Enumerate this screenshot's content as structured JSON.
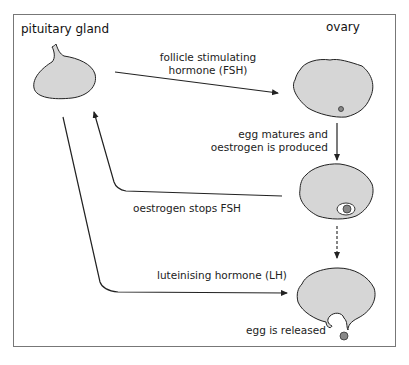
{
  "titles": {
    "pituitary": "pituitary gland",
    "ovary": "ovary"
  },
  "labels": {
    "fsh_line1": "follicle stimulating",
    "fsh_line2": "hormone (FSH)",
    "matures_line1": "egg matures and",
    "matures_line2": "oestrogen is produced",
    "oestrogen_stops": "oestrogen stops FSH",
    "lh": "luteinising hormone (LH)",
    "released": "egg is released"
  },
  "caption": "Hormonal control of the menstrual cycle",
  "colors": {
    "shape_fill": "#d6d6d6",
    "stroke": "#222222",
    "egg": "#888888",
    "frame": "#777777"
  }
}
